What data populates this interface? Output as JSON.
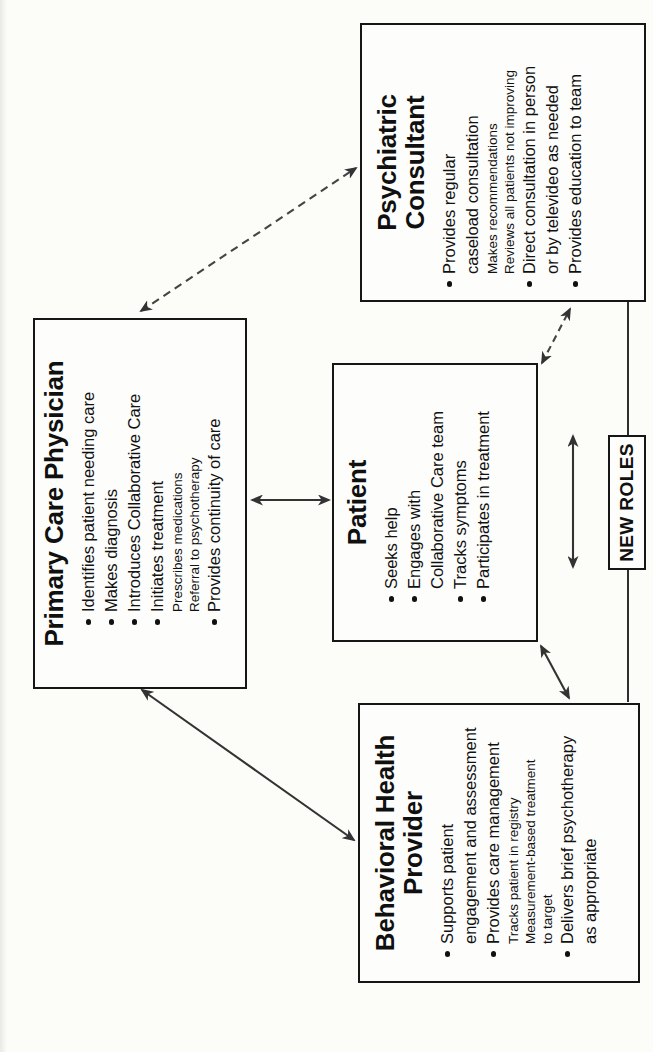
{
  "colors": {
    "ink": "#141414",
    "arrow": "#3a3a3a",
    "background": "#fcfcf9"
  },
  "boxes": {
    "pcp": {
      "title": "Primary Care Physician",
      "items": [
        {
          "text": "Identifies patient needing care",
          "type": "bullet"
        },
        {
          "text": "Makes diagnosis",
          "type": "bullet"
        },
        {
          "text": "Introduces Collaborative Care",
          "type": "bullet"
        },
        {
          "text": "Initiates treatment",
          "type": "bullet"
        },
        {
          "text": "Prescribes medications",
          "type": "sub"
        },
        {
          "text": "Referral to psychotherapy",
          "type": "sub"
        },
        {
          "text": "Provides continuity of care",
          "type": "bullet"
        }
      ]
    },
    "patient": {
      "title": "Patient",
      "items": [
        {
          "text": "Seeks help",
          "type": "bullet"
        },
        {
          "text": "Engages with",
          "type": "bullet"
        },
        {
          "text": "Collaborative Care team",
          "type": "cont"
        },
        {
          "text": "Tracks symptoms",
          "type": "bullet"
        },
        {
          "text": "Participates in treatment",
          "type": "bullet"
        }
      ]
    },
    "psychiatric": {
      "title": "Psychiatric Consultant",
      "items": [
        {
          "text": "Provides regular",
          "type": "bullet"
        },
        {
          "text": "caseload consultation",
          "type": "cont"
        },
        {
          "text": "Makes recommendations",
          "type": "sub"
        },
        {
          "text": "Reviews all patients not improving",
          "type": "sub"
        },
        {
          "text": "Direct consultation in person",
          "type": "bullet"
        },
        {
          "text": "or by televideo as needed",
          "type": "cont"
        },
        {
          "text": "Provides education to team",
          "type": "bullet"
        }
      ]
    },
    "bhp": {
      "title": "Behavioral Health Provider",
      "items": [
        {
          "text": "Supports patient",
          "type": "bullet"
        },
        {
          "text": "engagement and assessment",
          "type": "cont"
        },
        {
          "text": "Provides care management",
          "type": "bullet"
        },
        {
          "text": "Tracks patient in registry",
          "type": "sub"
        },
        {
          "text": "Measurement-based treatment",
          "type": "sub"
        },
        {
          "text": "to target",
          "type": "sub"
        },
        {
          "text": "Delivers brief psychotherapy",
          "type": "bullet"
        },
        {
          "text": "as appropriate",
          "type": "cont"
        }
      ]
    }
  },
  "new_roles": {
    "label": "NEW ROLES"
  },
  "connectors": [
    {
      "from": "primary-care-physician",
      "to": "psychiatric-consultant",
      "style": "dashed",
      "bidirectional": true
    },
    {
      "from": "primary-care-physician",
      "to": "patient",
      "style": "solid",
      "bidirectional": true
    },
    {
      "from": "primary-care-physician",
      "to": "behavioral-health-provider",
      "style": "solid",
      "bidirectional": true
    },
    {
      "from": "patient",
      "to": "behavioral-health-provider",
      "style": "solid",
      "bidirectional": true
    },
    {
      "from": "patient",
      "to": "psychiatric-consultant",
      "style": "dashed",
      "bidirectional": true
    },
    {
      "from": "behavioral-health-provider",
      "to": "psychiatric-consultant",
      "style": "solid-line-through-new-roles",
      "bidirectional": true
    }
  ]
}
